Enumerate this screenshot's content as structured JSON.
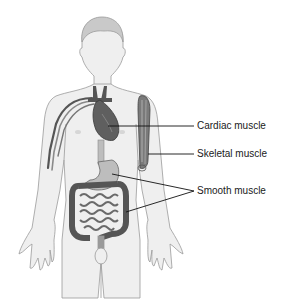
{
  "diagram": {
    "labels": [
      {
        "id": "cardiac",
        "text": "Cardiac muscle",
        "x": 197,
        "y": 120
      },
      {
        "id": "skeletal",
        "text": "Skeletal muscle",
        "x": 197,
        "y": 148
      },
      {
        "id": "smooth",
        "text": "Smooth muscle",
        "x": 197,
        "y": 185
      }
    ],
    "colors": {
      "body_fill": "#efefef",
      "body_outline": "#9a9a9a",
      "organ_dark": "#555555",
      "organ_mid": "#8a8a8a",
      "organ_light": "#bdbdbd",
      "leader_line": "#111111",
      "text": "#1a1a1a"
    }
  }
}
